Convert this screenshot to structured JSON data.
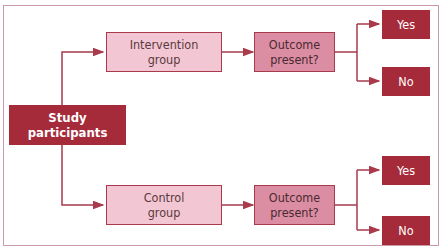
{
  "diagram": {
    "root": {
      "label_line1": "Study",
      "label_line2": "participants"
    },
    "groups": [
      {
        "label_line1": "Intervention",
        "label_line2": "group",
        "outcome": {
          "label_line1": "Outcome",
          "label_line2": "present?"
        },
        "yes": "Yes",
        "no": "No"
      },
      {
        "label_line1": "Control",
        "label_line2": "group",
        "outcome": {
          "label_line1": "Outcome",
          "label_line2": "present?"
        },
        "yes": "Yes",
        "no": "No"
      }
    ],
    "colors": {
      "dark": "#a52a3a",
      "light": "#f3c6d3",
      "mid": "#db8da3",
      "line": "#a83a4c",
      "frame": "#c99aa8"
    }
  }
}
